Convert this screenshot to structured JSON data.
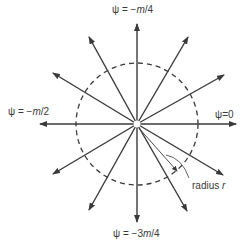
{
  "diagram": {
    "type": "radial-field",
    "center": {
      "x": 137,
      "y": 124
    },
    "circle_radius": 61,
    "line_color": "#3a3a3a",
    "arrows": [
      {
        "id": "psi-0",
        "angle_deg": 0,
        "tip": {
          "x": 236,
          "y": 124
        }
      },
      {
        "id": "up-right-shallow",
        "angle_deg": -25,
        "tip": {
          "x": 224,
          "y": 75
        }
      },
      {
        "id": "up-right-steep",
        "angle_deg": -62,
        "tip": {
          "x": 188,
          "y": 37
        }
      },
      {
        "id": "psi-minus-m-over-4",
        "angle_deg": -90,
        "tip": {
          "x": 137,
          "y": 24
        }
      },
      {
        "id": "up-left-steep",
        "angle_deg": -118,
        "tip": {
          "x": 89,
          "y": 37
        }
      },
      {
        "id": "up-left-shallow",
        "angle_deg": -155,
        "tip": {
          "x": 53,
          "y": 73
        }
      },
      {
        "id": "psi-minus-m-over-2",
        "angle_deg": 180,
        "tip": {
          "x": 40,
          "y": 124
        }
      },
      {
        "id": "down-left-shallow",
        "angle_deg": 155,
        "tip": {
          "x": 53,
          "y": 174
        }
      },
      {
        "id": "down-left-steep",
        "angle_deg": 118,
        "tip": {
          "x": 89,
          "y": 210
        }
      },
      {
        "id": "psi-minus-3m-over-4",
        "angle_deg": 90,
        "tip": {
          "x": 137,
          "y": 222
        }
      },
      {
        "id": "down-right-steep",
        "angle_deg": 62,
        "tip": {
          "x": 187,
          "y": 211
        }
      },
      {
        "id": "down-right-shallow",
        "angle_deg": 25,
        "tip": {
          "x": 223,
          "y": 175
        }
      }
    ],
    "radius_indicator": {
      "from": {
        "x": 137,
        "y": 126
      },
      "to": {
        "x": 177,
        "y": 171
      }
    },
    "labels": {
      "top": {
        "psi": "ψ",
        "eq": " = −",
        "var": "m",
        "rest": "/4"
      },
      "left": {
        "psi": "ψ",
        "eq": " = −",
        "var": "m",
        "rest": "/2"
      },
      "right": {
        "psi": "ψ",
        "eq": "=0"
      },
      "bottom": {
        "psi": "ψ",
        "eq": " = −3",
        "var": "m",
        "rest": "/4"
      },
      "radius": {
        "text": "radius ",
        "var": "r"
      }
    }
  }
}
